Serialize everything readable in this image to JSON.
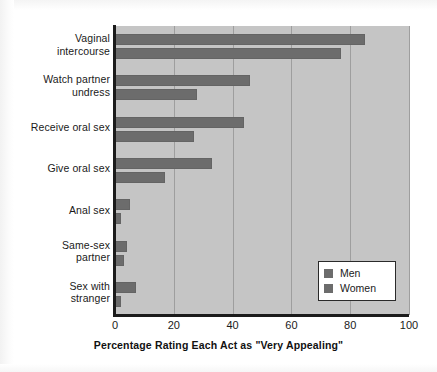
{
  "chart_data": {
    "type": "bar",
    "orientation": "horizontal",
    "title": "",
    "xlabel": "Percentage Rating Each Act as \"Very Appealing\"",
    "ylabel": "",
    "xlim": [
      0,
      100
    ],
    "xticks": [
      0,
      20,
      40,
      60,
      80,
      100
    ],
    "xtick_labels": [
      "0",
      "20",
      "40",
      "60",
      "80",
      "100"
    ],
    "grid": "vertical",
    "legend_position": "lower right",
    "categories": [
      "Vaginal intercourse",
      "Watch partner undress",
      "Receive oral sex",
      "Give oral sex",
      "Anal sex",
      "Same-sex partner",
      "Sex with stranger"
    ],
    "category_lines": [
      [
        "Vaginal",
        "intercourse"
      ],
      [
        "Watch partner",
        "undress"
      ],
      [
        "Receive oral sex"
      ],
      [
        "Give oral sex"
      ],
      [
        "Anal sex"
      ],
      [
        "Same-sex",
        "partner"
      ],
      [
        "Sex with",
        "stranger"
      ]
    ],
    "series": [
      {
        "name": "Men",
        "color": "#6c6c6c",
        "values": [
          85,
          46,
          44,
          33,
          5,
          4,
          7
        ]
      },
      {
        "name": "Women",
        "color": "#6c6c6c",
        "values": [
          77,
          28,
          27,
          17,
          2,
          3,
          2
        ]
      }
    ],
    "colors": {
      "bar": "#6c6c6c",
      "plot_background": "#c5c5c5",
      "gridline": "#9e9e9e",
      "axis": "#1b1b1b",
      "text": "#1a1a1a",
      "figure_background": "#ffffff"
    }
  },
  "legend": {
    "entries": [
      {
        "label": "Men"
      },
      {
        "label": "Women"
      }
    ]
  }
}
